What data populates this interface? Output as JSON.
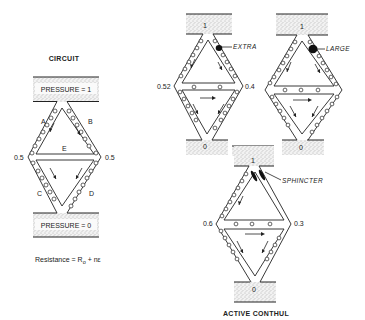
{
  "left_panel": {
    "title": "CIRCUIT",
    "top_reservoir": "PRESSURE = 1",
    "bottom_reservoir": "PRESSURE = 0",
    "vessels": [
      "A",
      "B",
      "C",
      "D",
      "E"
    ],
    "left_node_pressure": "0.5",
    "right_node_pressure": "0.5",
    "formula": {
      "prefix": "Resistance  =  R",
      "subscript": "o",
      "suffix": "  +  nε"
    }
  },
  "top_middle": {
    "top_pressure": "1",
    "bottom_pressure": "0",
    "left_node_pressure": "0.52",
    "right_node_pressure": "0.4",
    "annotation": "EXTRA"
  },
  "top_right": {
    "top_pressure": "1",
    "bottom_pressure": "0",
    "annotation": "LARGE"
  },
  "bottom_center": {
    "top_pressure": "1",
    "bottom_pressure": "0",
    "left_node_pressure": "0.6",
    "right_node_pressure": "0.3",
    "annotation": "SPHINCTER",
    "caption": "ACTIVE CONTHUL"
  }
}
